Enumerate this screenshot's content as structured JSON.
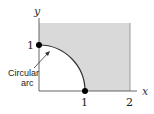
{
  "diagram": {
    "axes": {
      "x_label": "x",
      "y_label": "y",
      "x_ticks": [
        "1",
        "2"
      ],
      "y_ticks": [
        "1"
      ]
    },
    "annotation": {
      "line1": "Circular",
      "line2": "arc"
    },
    "region": {
      "description": "Shaded region 0<=x<=2, 0<=y<=~1.5 outside unit circle quarter arc",
      "fill_color": "#d9d9d9"
    },
    "points": [
      {
        "label": "(0,1)",
        "x": 0,
        "y": 1
      },
      {
        "label": "(1,0)",
        "x": 1,
        "y": 0
      }
    ],
    "colors": {
      "axis": "#555555",
      "arc": "#333333",
      "shade": "#d9d9d9",
      "point": "#000000"
    }
  }
}
